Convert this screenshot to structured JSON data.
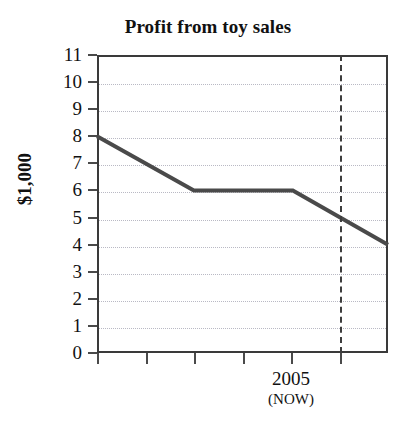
{
  "chart_data": {
    "type": "line",
    "title": "Profit from toy sales",
    "xlabel": "",
    "ylabel": "$1,000",
    "ylim": [
      0,
      11
    ],
    "grid": true,
    "legend": false,
    "y_ticks": [
      11,
      10,
      9,
      8,
      7,
      6,
      5,
      4,
      3,
      2,
      1,
      0
    ],
    "y_tick_labels": [
      "11",
      "10",
      "9",
      "8",
      "7",
      "6",
      "5",
      "4",
      "3",
      "2",
      "1",
      "0"
    ],
    "x_tick_count": 6,
    "x_tick_labels": [
      "",
      "",
      "",
      "",
      "2005",
      ""
    ],
    "x_tick_sublabels": [
      "",
      "",
      "",
      "",
      "(NOW)",
      ""
    ],
    "annotations": [
      {
        "name": "now-line",
        "type": "vertical-dashed-line",
        "at_x_tick": 5,
        "label": "2005",
        "sublabel": "(NOW)"
      }
    ],
    "series": [
      {
        "name": "profit",
        "color": "#4a4a4a",
        "points": [
          {
            "x_frac": 0.0,
            "y": 8
          },
          {
            "x_frac": 0.333,
            "y": 6
          },
          {
            "x_frac": 0.673,
            "y": 6
          },
          {
            "x_frac": 1.0,
            "y": 4
          }
        ]
      }
    ],
    "colors": {
      "line": "#4a4a4a",
      "axis": "#3a3a3a",
      "grid": "#b9b9c4",
      "text": "#111111",
      "background": "#ffffff"
    }
  }
}
